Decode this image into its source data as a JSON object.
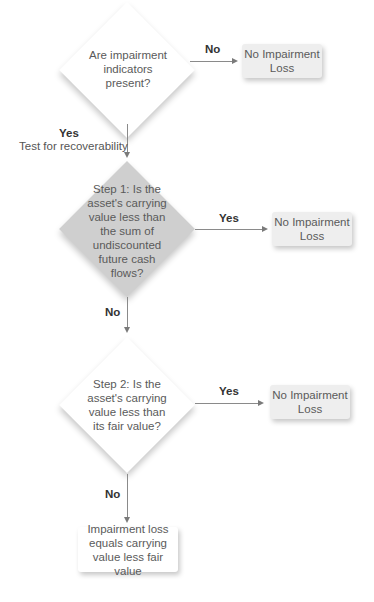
{
  "flowchart": {
    "decision1": {
      "text": "Are impairment indicators present?"
    },
    "decision1_no_label": "No",
    "outcome1": {
      "text": "No Impairment Loss"
    },
    "decision1_yes_label": "Yes",
    "decision1_yes_sublabel": "Test for recoverability",
    "decision2": {
      "text": "Step 1: Is the asset's carrying value less than the sum of undiscounted future cash flows?"
    },
    "decision2_yes_label": "Yes",
    "outcome2": {
      "text": "No Impairment Loss"
    },
    "decision2_no_label": "No",
    "decision3": {
      "text": "Step 2: Is the asset's carrying value less than its fair value?"
    },
    "decision3_yes_label": "Yes",
    "outcome3": {
      "text": "No Impairment Loss"
    },
    "decision3_no_label": "No",
    "outcome4": {
      "text": "Impairment loss equals carrying value less fair value"
    }
  },
  "colors": {
    "diamond_white": "#ffffff",
    "diamond_grey": "#cfcfcf",
    "outcome_box_grey": "#eeeeee",
    "connector": "#8a8a8a"
  }
}
